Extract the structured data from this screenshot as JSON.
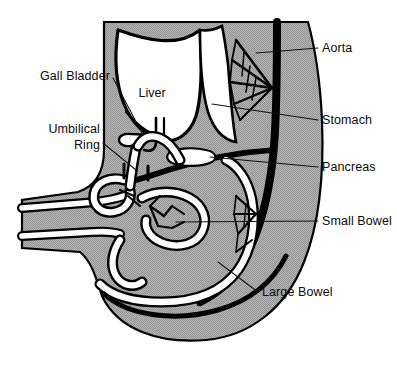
{
  "figure": {
    "background_color": "#ffffff",
    "ink_color": "#000000",
    "body_fill_color": "#a9a9a9",
    "organ_fill_color": "#ffffff"
  },
  "labels": {
    "left": [
      {
        "id": "gall-bladder",
        "text": "Gall Bladder",
        "x": 110,
        "y": 80,
        "lines": [
          "Gall Bladder"
        ]
      },
      {
        "id": "umbilical-ring",
        "text": "Umbilical Ring",
        "x": 100,
        "y": 133,
        "lines": [
          "Umbilical",
          "Ring"
        ]
      }
    ],
    "right": [
      {
        "id": "aorta",
        "text": "Aorta",
        "x": 322,
        "y": 52
      },
      {
        "id": "stomach",
        "text": "Stomach",
        "x": 322,
        "y": 124
      },
      {
        "id": "pancreas",
        "text": "Pancreas",
        "x": 322,
        "y": 171
      },
      {
        "id": "small-bowel",
        "text": "Small Bowel",
        "x": 322,
        "y": 225
      },
      {
        "id": "large-bowel",
        "text": "Large Bowel",
        "x": 262,
        "y": 296
      }
    ],
    "inline": [
      {
        "id": "liver",
        "text": "Liver",
        "x": 152,
        "y": 97
      }
    ]
  },
  "structures": [
    {
      "id": "body-wall",
      "name": "fetal body wall / trunk outline"
    },
    {
      "id": "liver",
      "name": "liver"
    },
    {
      "id": "gall-bladder",
      "name": "gall bladder"
    },
    {
      "id": "stomach",
      "name": "stomach"
    },
    {
      "id": "pancreas",
      "name": "pancreas"
    },
    {
      "id": "aorta",
      "name": "aorta"
    },
    {
      "id": "mesenteric-vessels",
      "name": "mesenteric vessel fan"
    },
    {
      "id": "small-bowel",
      "name": "small bowel loops"
    },
    {
      "id": "large-bowel",
      "name": "large bowel"
    },
    {
      "id": "umbilical-cord",
      "name": "umbilical cord"
    },
    {
      "id": "umbilical-ring",
      "name": "umbilical ring"
    }
  ]
}
